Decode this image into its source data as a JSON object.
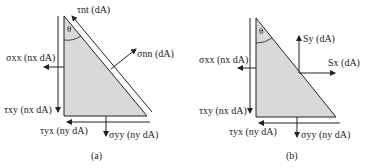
{
  "panels": [
    {
      "caption": "(a)",
      "angle_label": "θ",
      "labels": {
        "tau_nt": "τnt (dA)",
        "sigma_nn": "σnn (dA)",
        "sigma_xx": "σxx (nx dA)",
        "tau_xy": "τxy (nx dA)",
        "tau_yx": "τyx (ny dA)",
        "sigma_yy": "σyy (ny dA)"
      }
    },
    {
      "caption": "(b)",
      "angle_label": "θ",
      "labels": {
        "S_y": "Sy (dA)",
        "S_x": "Sx (dA)",
        "sigma_xx": "σxx (nx dA)",
        "tau_xy": "τxy (nx dA)",
        "tau_yx": "τyx (ny dA)",
        "sigma_yy": "σyy (ny dA)"
      }
    }
  ],
  "colors": {
    "fill": "#d9d9d9",
    "stroke": "#222222"
  }
}
